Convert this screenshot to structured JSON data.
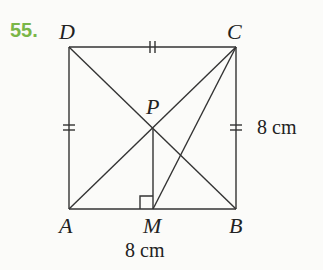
{
  "problem": {
    "number": "55.",
    "number_color": "#7ab648"
  },
  "figure": {
    "type": "square with diagonals",
    "points": {
      "A": {
        "label": "A",
        "x": 69,
        "y": 209
      },
      "B": {
        "label": "B",
        "x": 236,
        "y": 209
      },
      "C": {
        "label": "C",
        "x": 236,
        "y": 47
      },
      "D": {
        "label": "D",
        "x": 69,
        "y": 47
      },
      "P": {
        "label": "P",
        "x": 153,
        "y": 129
      },
      "M": {
        "label": "M",
        "x": 153,
        "y": 209
      }
    },
    "measurements": {
      "side_bc": "8 cm",
      "side_ab": "8 cm"
    },
    "segments": [
      "AB",
      "BC",
      "CD",
      "DA",
      "AC",
      "BD",
      "PM",
      "CM"
    ],
    "tick_marks": {
      "DC": 2,
      "DA": 2,
      "CB": 2
    },
    "right_angle_at": "M"
  }
}
